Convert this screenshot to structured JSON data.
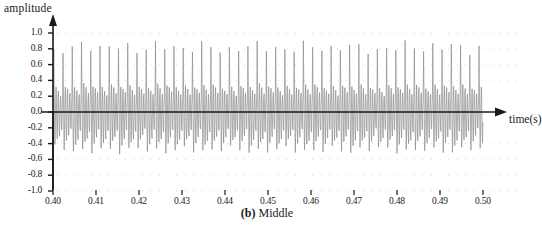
{
  "chart_data": {
    "type": "line",
    "title": "",
    "caption_prefix": "(b)",
    "caption_text": "Middle",
    "xlabel": "time(s)",
    "ylabel": "amplitude",
    "xlim": [
      0.4,
      0.5
    ],
    "ylim": [
      -1.0,
      1.0
    ],
    "xticks": [
      "0.40",
      "0.41",
      "0.42",
      "0.43",
      "0.44",
      "0.45",
      "0.46",
      "0.47",
      "0.48",
      "0.49",
      "0.50"
    ],
    "xtick_values": [
      0.4,
      0.41,
      0.42,
      0.43,
      0.44,
      0.45,
      0.46,
      0.47,
      0.48,
      0.49,
      0.5
    ],
    "yticks": [
      "1.0",
      "0.8",
      "0.6",
      "0.4",
      "0.2",
      "0.0",
      "-0.2",
      "-0.4",
      "-0.6",
      "-0.8",
      "-1.0"
    ],
    "ytick_values": [
      1.0,
      0.8,
      0.6,
      0.4,
      0.2,
      0.0,
      -0.2,
      -0.4,
      -0.6,
      -0.8,
      -1.0
    ],
    "grid": "dotted-horizontal",
    "legend": "none",
    "series_name": "speech waveform (middle segment)",
    "trace_color": "#8c8c8c",
    "axis_color": "#1a1a1a",
    "grid_color": "#c9c9c9",
    "burst_period_s": 0.00215,
    "peak_positive": 0.85,
    "peak_negative": -0.58,
    "samples_per_period": 24,
    "pulse_shape": [
      0.06,
      0.2,
      0.85,
      0.3,
      -0.18,
      -0.5,
      -0.26,
      0.16,
      0.34,
      0.12,
      -0.22,
      -0.4,
      -0.14,
      0.22,
      0.3,
      0.05,
      -0.26,
      -0.34,
      -0.08,
      0.18,
      0.24,
      0.02,
      -0.2,
      -0.24
    ],
    "envelope": [
      0.88,
      0.93,
      0.97,
      1.0,
      0.98,
      0.94,
      0.97,
      1.0,
      0.96,
      0.91,
      0.95,
      0.99,
      1.0,
      0.96,
      0.92,
      0.96,
      1.0,
      0.97,
      0.93,
      0.9,
      0.95,
      0.99,
      1.0,
      0.97,
      0.94,
      0.91,
      0.96,
      1.0,
      0.98,
      0.95,
      0.92,
      0.97,
      1.0,
      0.96,
      0.93,
      0.9,
      0.94,
      0.98,
      1.0,
      0.97,
      0.93,
      0.96,
      0.99,
      1.0,
      0.95,
      0.91,
      0.94
    ]
  },
  "axes": {
    "x_arrow": true,
    "y_arrow": true
  }
}
